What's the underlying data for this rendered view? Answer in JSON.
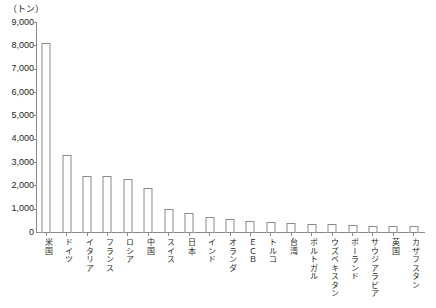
{
  "chart_data": {
    "type": "bar",
    "title": "",
    "subtitle": "",
    "unit_label": "（トン）",
    "xlabel": "",
    "ylabel": "",
    "ylim": [
      0,
      9000
    ],
    "ytick_labels": [
      "9,000",
      "8,000",
      "7,000",
      "6,000",
      "5,000",
      "4,000",
      "3,000",
      "2,000",
      "1,000",
      "0"
    ],
    "ytick_values": [
      9000,
      8000,
      7000,
      6000,
      5000,
      4000,
      3000,
      2000,
      1000,
      0
    ],
    "grid": false,
    "legend": "none",
    "categories": [
      "米国",
      "ドイツ",
      "イタリア",
      "フランス",
      "ロシア",
      "中国",
      "スイス",
      "日本",
      "インド",
      "オランダ",
      "ＥＣＢ",
      "トルコ",
      "台湾",
      "ポルトガル",
      "ウズベキスタン",
      "ポーランド",
      "サウジアラビア",
      "英国",
      "カザフスタン"
    ],
    "values": [
      8130,
      3360,
      2450,
      2440,
      2330,
      1950,
      1040,
      850,
      690,
      610,
      510,
      490,
      420,
      380,
      370,
      340,
      320,
      310,
      300
    ]
  }
}
